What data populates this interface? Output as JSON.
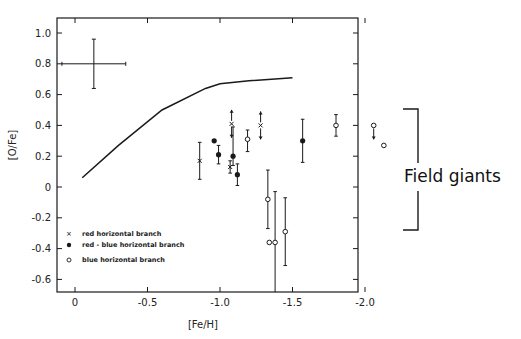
{
  "chart_data": {
    "type": "scatter",
    "title": "",
    "xlabel": "[Fe/H]",
    "ylabel": "[O/Fe]",
    "xlim": [
      0.12,
      -2.2
    ],
    "ylim": [
      -0.7,
      1.1
    ],
    "x_ticks": [
      0,
      -0.5,
      -1.0,
      -1.5,
      -2.0
    ],
    "x_tick_labels": [
      "0",
      "-0.5",
      "-1.0",
      "-1.5",
      "-2.0"
    ],
    "y_ticks": [
      1.0,
      0.8,
      0.6,
      0.4,
      0.2,
      0,
      -0.2,
      -0.4,
      -0.6
    ],
    "y_tick_labels": [
      "1.0",
      "0.8",
      "0.6",
      "0.4",
      "0.2",
      "0",
      "-0.2",
      "-0.4",
      "-0.6"
    ],
    "grid": false,
    "legend_position": "lower-left",
    "legend": [
      {
        "marker": "x",
        "label": "red horizontal branch"
      },
      {
        "marker": "filled-circle",
        "label": "red - blue horizontal branch"
      },
      {
        "marker": "open-circle",
        "label": "blue horizontal branch"
      }
    ],
    "error_cross": {
      "x": -0.13,
      "y": 0.8,
      "xerr": 0.22,
      "yerr_up": 0.16,
      "yerr_down": 0.16
    },
    "field_giants_curve": [
      {
        "x": -0.05,
        "y": 0.06
      },
      {
        "x": -0.3,
        "y": 0.27
      },
      {
        "x": -0.6,
        "y": 0.5
      },
      {
        "x": -0.9,
        "y": 0.64
      },
      {
        "x": -1.0,
        "y": 0.67
      },
      {
        "x": -1.2,
        "y": 0.69
      },
      {
        "x": -1.5,
        "y": 0.71
      }
    ],
    "series": [
      {
        "name": "red horizontal branch",
        "marker": "x",
        "points": [
          {
            "x": -0.86,
            "y": 0.17,
            "err_up": 0.12,
            "err_down": 0.12
          },
          {
            "x": -1.08,
            "y": 0.41,
            "upper_arrow": true,
            "lower_arrow": true
          },
          {
            "x": -1.07,
            "y": 0.13,
            "err_up": 0.04,
            "err_down": 0.04
          },
          {
            "x": -1.28,
            "y": 0.4,
            "upper_arrow": true,
            "lower_arrow": true
          }
        ]
      },
      {
        "name": "red - blue horizontal branch",
        "marker": "filled-circle",
        "points": [
          {
            "x": -0.96,
            "y": 0.3
          },
          {
            "x": -0.99,
            "y": 0.21,
            "err_up": 0.06,
            "err_down": 0.06
          },
          {
            "x": -1.09,
            "y": 0.2,
            "err_up": 0.19,
            "err_down": 0.06
          },
          {
            "x": -1.12,
            "y": 0.08,
            "err_up": 0.07,
            "err_down": 0.07
          },
          {
            "x": -1.57,
            "y": 0.3,
            "err_up": 0.14,
            "err_down": 0.14
          }
        ]
      },
      {
        "name": "blue horizontal branch",
        "marker": "open-circle",
        "points": [
          {
            "x": -1.19,
            "y": 0.31,
            "err_up": 0.06,
            "err_down": 0.08
          },
          {
            "x": -1.33,
            "y": -0.08,
            "err_up": 0.19,
            "err_down": 0.19
          },
          {
            "x": -1.34,
            "y": -0.36
          },
          {
            "x": -1.38,
            "y": -0.36,
            "err_up": 0.33,
            "err_down": 0.36
          },
          {
            "x": -1.45,
            "y": -0.29,
            "err_up": 0.22,
            "err_down": 0.22
          },
          {
            "x": -1.8,
            "y": 0.4,
            "err_up": 0.07,
            "err_down": 0.07
          },
          {
            "x": -2.06,
            "y": 0.4,
            "lower_arrow": true
          },
          {
            "x": -2.13,
            "y": 0.27
          }
        ]
      }
    ],
    "annotations": [
      {
        "text": "Field giants",
        "type": "bracket",
        "y_top": 0.5,
        "y_bottom": -0.27
      }
    ]
  },
  "labels": {
    "xlabel": "[Fe/H]",
    "ylabel": "[O/Fe]",
    "annotation": "Field giants",
    "legend": [
      "red horizontal branch",
      "red - blue horizontal branch",
      "blue horizontal branch"
    ],
    "x_ticks": [
      "0",
      "-0.5",
      "-1.0",
      "-1.5",
      "-2.0"
    ],
    "y_ticks": [
      "1.0",
      "0.8",
      "0.6",
      "0.4",
      "0.2",
      "0",
      "-0.2",
      "-0.4",
      "-0.6"
    ]
  },
  "colors": {
    "ink": "#1a1a1a",
    "background": "#ffffff"
  }
}
